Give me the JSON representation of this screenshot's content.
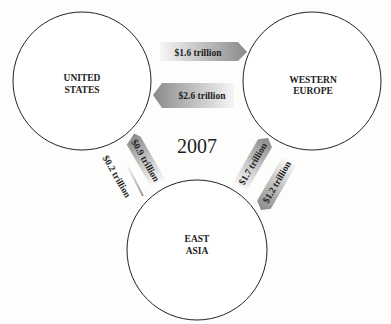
{
  "title": "2007",
  "regions": [
    {
      "id": "us",
      "line1": "UNITED",
      "line2": "STATES"
    },
    {
      "id": "we",
      "line1": "WESTERN",
      "line2": "EUROPE"
    },
    {
      "id": "ea",
      "line1": "EAST",
      "line2": "ASIA"
    }
  ],
  "flows": [
    {
      "from": "United States",
      "to": "Western Europe",
      "label": "$1.6 trillion"
    },
    {
      "from": "Western Europe",
      "to": "United States",
      "label": "$2.6 trillion"
    },
    {
      "from": "East Asia",
      "to": "United States",
      "label": "$0.9 trillion"
    },
    {
      "from": "United States",
      "to": "East Asia",
      "label": "$0.2 trillion"
    },
    {
      "from": "East Asia",
      "to": "Western Europe",
      "label": "$1.7 trillion"
    },
    {
      "from": "Western Europe",
      "to": "East Asia",
      "label": "$1.2 trillion"
    }
  ],
  "colors": {
    "arrow_dark": "#8c8c8c",
    "arrow_light": "#f4f4f4",
    "circle_stroke": "#222222"
  }
}
